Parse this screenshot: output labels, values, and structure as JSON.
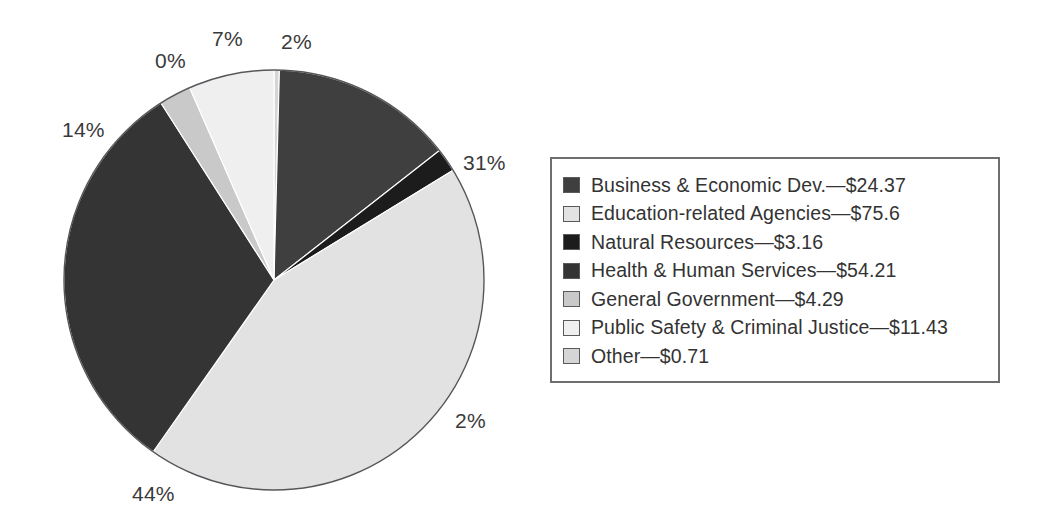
{
  "chart_data": {
    "type": "pie",
    "title": "",
    "subtitle": "",
    "xlabel": "",
    "ylabel": "",
    "grid": false,
    "legend_position": "right",
    "value_prefix": "$",
    "units": "billions of dollars",
    "start_angle_deg": 0,
    "direction": "clockwise",
    "categories": [
      "Business & Economic Dev.",
      "Education-related Agencies",
      "Natural Resources",
      "Health & Human Services",
      "General Government",
      "Public Safety & Criminal Justice",
      "Other"
    ],
    "values": [
      24.37,
      75.6,
      3.16,
      54.21,
      4.29,
      11.43,
      0.71
    ],
    "percent_labels": [
      "31%",
      "44%",
      "2%",
      "14%",
      "0%",
      "7%",
      "2%"
    ],
    "colors": [
      "#3f3f3f",
      "#e2e2e2",
      "#1c1c1c",
      "#343434",
      "#c9c9c9",
      "#efefef",
      "#d5d5d5"
    ],
    "slices": [
      {
        "name": "Other",
        "value": 0.71,
        "percent": "2%",
        "percent_value": 2,
        "color": "#d5d5d5"
      },
      {
        "name": "Business & Economic Dev.",
        "value": 24.37,
        "percent": "31%",
        "percent_value": 31,
        "color": "#3f3f3f"
      },
      {
        "name": "Natural Resources",
        "value": 3.16,
        "percent": "2%",
        "percent_value": 2,
        "color": "#1c1c1c"
      },
      {
        "name": "Education-related Agencies",
        "value": 75.6,
        "percent": "44%",
        "percent_value": 44,
        "color": "#e2e2e2"
      },
      {
        "name": "Health & Human Services",
        "value": 54.21,
        "percent": "14%",
        "percent_value": 14,
        "color": "#343434"
      },
      {
        "name": "General Government",
        "value": 4.29,
        "percent": "0%",
        "percent_value": 0,
        "color": "#c9c9c9"
      },
      {
        "name": "Public Safety & Criminal Justice",
        "value": 11.43,
        "percent": "7%",
        "percent_value": 7,
        "color": "#efefef"
      }
    ]
  },
  "pie": {
    "labels": [
      {
        "id": "label-2pct-top",
        "text": "2%",
        "x": 281,
        "y": 31
      },
      {
        "id": "label-31pct",
        "text": "31%",
        "x": 463,
        "y": 152
      },
      {
        "id": "label-2pct-lower",
        "text": "2%",
        "x": 455,
        "y": 410
      },
      {
        "id": "label-44pct",
        "text": "44%",
        "x": 132,
        "y": 483
      },
      {
        "id": "label-14pct",
        "text": "14%",
        "x": 62,
        "y": 119
      },
      {
        "id": "label-0pct",
        "text": "0%",
        "x": 155,
        "y": 50
      },
      {
        "id": "label-7pct",
        "text": "7%",
        "x": 212,
        "y": 28
      }
    ]
  },
  "legend": {
    "items": [
      {
        "label": "Business & Economic Dev.—$24.37",
        "color": "#3f3f3f"
      },
      {
        "label": "Education-related Agencies—$75.6",
        "color": "#e2e2e2"
      },
      {
        "label": "Natural Resources—$3.16",
        "color": "#1c1c1c"
      },
      {
        "label": "Health & Human Services—$54.21",
        "color": "#343434"
      },
      {
        "label": "General Government—$4.29",
        "color": "#c9c9c9"
      },
      {
        "label": "Public Safety & Criminal Justice—$11.43",
        "color": "#efefef"
      },
      {
        "label": "Other—$0.71",
        "color": "#d5d5d5"
      }
    ],
    "border_color": "#6e6e6e"
  }
}
